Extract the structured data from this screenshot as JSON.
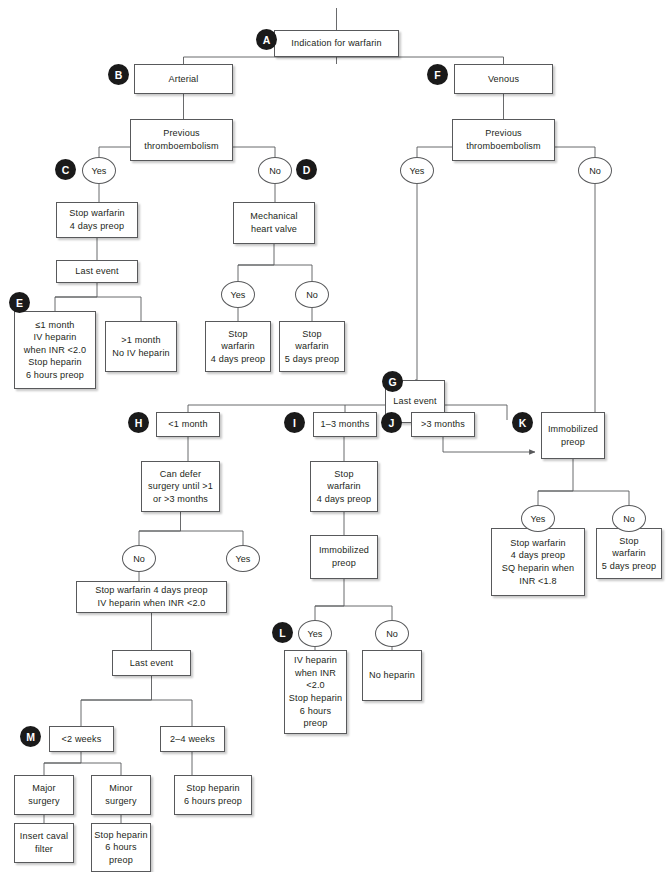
{
  "diagram": {
    "line_color": "#58595b",
    "tag_color": "#1a1a1a",
    "tag_text_color": "#ffffff",
    "box_fill": "#ffffff"
  },
  "tags": [
    {
      "id": "A",
      "label": "A",
      "x": 256,
      "y": 29
    },
    {
      "id": "B",
      "label": "B",
      "x": 108,
      "y": 64
    },
    {
      "id": "C",
      "label": "C",
      "x": 55,
      "y": 159
    },
    {
      "id": "D",
      "label": "D",
      "x": 296,
      "y": 159
    },
    {
      "id": "E",
      "label": "E",
      "x": 9,
      "y": 292
    },
    {
      "id": "F",
      "label": "F",
      "x": 427,
      "y": 64
    },
    {
      "id": "G",
      "label": "G",
      "x": 382,
      "y": 371
    },
    {
      "id": "H",
      "label": "H",
      "x": 128,
      "y": 412
    },
    {
      "id": "I",
      "label": "I",
      "x": 284,
      "y": 412
    },
    {
      "id": "J",
      "label": "J",
      "x": 381,
      "y": 412
    },
    {
      "id": "K",
      "label": "K",
      "x": 512,
      "y": 412
    },
    {
      "id": "L",
      "label": "L",
      "x": 272,
      "y": 622
    },
    {
      "id": "M",
      "label": "M",
      "x": 20,
      "y": 726
    }
  ],
  "nodes": [
    {
      "id": "indication",
      "name": "indication-for-warfarin",
      "text": "Indication for warfarin",
      "x": 274,
      "y": 30,
      "w": 125,
      "h": 27
    },
    {
      "id": "arterial",
      "name": "arterial",
      "text": "Arterial",
      "x": 134,
      "y": 64,
      "w": 99,
      "h": 30
    },
    {
      "id": "venous",
      "name": "venous",
      "text": "Venous",
      "x": 454,
      "y": 64,
      "w": 99,
      "h": 30
    },
    {
      "id": "prev-thromb-left",
      "name": "previous-thromboembolism-arterial",
      "text": "Previous\nthromboembolism",
      "x": 130,
      "y": 119,
      "w": 103,
      "h": 42
    },
    {
      "id": "prev-thromb-right",
      "name": "previous-thromboembolism-venous",
      "text": "Previous\nthromboembolism",
      "x": 452,
      "y": 119,
      "w": 103,
      "h": 42
    },
    {
      "id": "stop-warf-4d-c",
      "name": "stop-warfarin-4-days-preop-c",
      "text": "Stop warfarin\n4 days preop",
      "x": 56,
      "y": 202,
      "w": 82,
      "h": 36
    },
    {
      "id": "last-event-c",
      "name": "last-event-c",
      "text": "Last event",
      "x": 56,
      "y": 260,
      "w": 82,
      "h": 23
    },
    {
      "id": "le1month",
      "name": "less-equal-1-month-iv-heparin",
      "text": "≤1 month\nIV heparin\nwhen INR <2.0\nStop heparin\n6 hours preop",
      "x": 14,
      "y": 311,
      "w": 82,
      "h": 78
    },
    {
      "id": "gt1month",
      "name": "greater-1-month-no-iv-heparin",
      "text": ">1 month\nNo IV heparin",
      "x": 105,
      "y": 321,
      "w": 72,
      "h": 51
    },
    {
      "id": "mech-valve",
      "name": "mechanical-heart-valve",
      "text": "Mechanical\nheart valve",
      "x": 233,
      "y": 202,
      "w": 82,
      "h": 42
    },
    {
      "id": "stop-warf-4d-valve",
      "name": "stop-warfarin-4-days-preop-valve-yes",
      "text": "Stop\nwarfarin\n4 days preop",
      "x": 205,
      "y": 321,
      "w": 66,
      "h": 51
    },
    {
      "id": "stop-warf-5d-valve",
      "name": "stop-warfarin-5-days-preop-valve-no",
      "text": "Stop\nwarfarin\n5 days preop",
      "x": 279,
      "y": 321,
      "w": 66,
      "h": 51
    },
    {
      "id": "last-event-g",
      "name": "last-event-g",
      "text": "Last event",
      "x": 385,
      "y": 380,
      "w": 60,
      "h": 43
    },
    {
      "id": "lt1month",
      "name": "less-1-month",
      "text": "<1 month",
      "x": 156,
      "y": 412,
      "w": 64,
      "h": 25
    },
    {
      "id": "can-defer",
      "name": "can-defer-surgery",
      "text": "Can defer\nsurgery until >1\nor >3 months",
      "x": 141,
      "y": 461,
      "w": 79,
      "h": 51
    },
    {
      "id": "m1to3",
      "name": "one-to-three-months",
      "text": "1–3 months",
      "x": 313,
      "y": 412,
      "w": 64,
      "h": 25
    },
    {
      "id": "stop-warf-4d-i",
      "name": "stop-warfarin-4-days-preop-i",
      "text": "Stop\nwarfarin\n4 days preop",
      "x": 310,
      "y": 461,
      "w": 68,
      "h": 51
    },
    {
      "id": "immob-preop-i",
      "name": "immobilized-preop-i",
      "text": "Immobilized\npreop",
      "x": 310,
      "y": 535,
      "w": 68,
      "h": 44
    },
    {
      "id": "gt3months",
      "name": "greater-3-months",
      "text": ">3 months",
      "x": 411,
      "y": 412,
      "w": 64,
      "h": 25
    },
    {
      "id": "immob-preop-k",
      "name": "immobilized-preop-k",
      "text": "Immobilized\npreop",
      "x": 541,
      "y": 412,
      "w": 64,
      "h": 47
    },
    {
      "id": "stop-warf-sq",
      "name": "stop-warfarin-sq-heparin",
      "text": "Stop warfarin\n4 days preop\nSQ heparin when\nINR <1.8",
      "x": 491,
      "y": 528,
      "w": 94,
      "h": 68
    },
    {
      "id": "stop-warf-5d-k",
      "name": "stop-warfarin-5-days-preop-k",
      "text": "Stop\nwarfarin\n5 days preop",
      "x": 596,
      "y": 528,
      "w": 66,
      "h": 51
    },
    {
      "id": "stop-warf-iv",
      "name": "stop-warfarin-iv-heparin",
      "text": "Stop warfarin 4 days preop\nIV heparin when INR <2.0",
      "x": 76,
      "y": 581,
      "w": 151,
      "h": 32
    },
    {
      "id": "last-event-m",
      "name": "last-event-m",
      "text": "Last event",
      "x": 112,
      "y": 650,
      "w": 79,
      "h": 26
    },
    {
      "id": "lt2weeks",
      "name": "less-2-weeks",
      "text": "<2 weeks",
      "x": 49,
      "y": 726,
      "w": 65,
      "h": 26
    },
    {
      "id": "w2to4",
      "name": "two-to-four-weeks",
      "text": "2–4 weeks",
      "x": 160,
      "y": 726,
      "w": 65,
      "h": 26
    },
    {
      "id": "major-surgery",
      "name": "major-surgery",
      "text": "Major\nsurgery",
      "x": 14,
      "y": 775,
      "w": 60,
      "h": 40
    },
    {
      "id": "minor-surgery",
      "name": "minor-surgery",
      "text": "Minor\nsurgery",
      "x": 91,
      "y": 775,
      "w": 60,
      "h": 40
    },
    {
      "id": "stop-hep-24",
      "name": "stop-heparin-6-hours-preop-2-4-weeks",
      "text": "Stop heparin\n6 hours preop",
      "x": 174,
      "y": 775,
      "w": 78,
      "h": 40
    },
    {
      "id": "insert-caval",
      "name": "insert-caval-filter",
      "text": "Insert caval\nfilter",
      "x": 14,
      "y": 823,
      "w": 60,
      "h": 40
    },
    {
      "id": "stop-hep-minor",
      "name": "stop-heparin-6-hours-preop-minor",
      "text": "Stop heparin\n6 hours\npreop",
      "x": 91,
      "y": 823,
      "w": 60,
      "h": 49
    },
    {
      "id": "iv-heparin-l",
      "name": "iv-heparin-when-inr-l",
      "text": "IV heparin\nwhen INR\n<2.0\nStop heparin\n6 hours\npreop",
      "x": 284,
      "y": 650,
      "w": 63,
      "h": 84
    },
    {
      "id": "no-heparin",
      "name": "no-heparin",
      "text": "No heparin",
      "x": 362,
      "y": 650,
      "w": 60,
      "h": 51
    }
  ],
  "ovals": [
    {
      "id": "yes-c",
      "name": "yes-oval-arterial-thromb",
      "text": "Yes",
      "x": 82,
      "y": 157,
      "w": 34,
      "h": 27
    },
    {
      "id": "no-d",
      "name": "no-oval-arterial-thromb",
      "text": "No",
      "x": 258,
      "y": 157,
      "w": 34,
      "h": 27
    },
    {
      "id": "yes-f",
      "name": "yes-oval-venous-thromb",
      "text": "Yes",
      "x": 400,
      "y": 157,
      "w": 34,
      "h": 27
    },
    {
      "id": "no-f",
      "name": "no-oval-venous-thromb",
      "text": "No",
      "x": 578,
      "y": 157,
      "w": 34,
      "h": 27
    },
    {
      "id": "yes-valve",
      "name": "yes-oval-mechanical-valve",
      "text": "Yes",
      "x": 221,
      "y": 281,
      "w": 34,
      "h": 27
    },
    {
      "id": "no-valve",
      "name": "no-oval-mechanical-valve",
      "text": "No",
      "x": 295,
      "y": 281,
      "w": 34,
      "h": 27
    },
    {
      "id": "no-defer",
      "name": "no-oval-can-defer",
      "text": "No",
      "x": 122,
      "y": 545,
      "w": 34,
      "h": 27
    },
    {
      "id": "yes-defer",
      "name": "yes-oval-can-defer",
      "text": "Yes",
      "x": 226,
      "y": 545,
      "w": 34,
      "h": 27
    },
    {
      "id": "yes-immob-i",
      "name": "yes-oval-immobilized-i",
      "text": "Yes",
      "x": 298,
      "y": 620,
      "w": 34,
      "h": 27
    },
    {
      "id": "no-immob-i",
      "name": "no-oval-immobilized-i",
      "text": "No",
      "x": 375,
      "y": 620,
      "w": 34,
      "h": 27
    },
    {
      "id": "yes-immob-k",
      "name": "yes-oval-immobilized-k",
      "text": "Yes",
      "x": 521,
      "y": 505,
      "w": 34,
      "h": 27
    },
    {
      "id": "no-immob-k",
      "name": "no-oval-immobilized-k",
      "text": "No",
      "x": 612,
      "y": 505,
      "w": 34,
      "h": 27
    }
  ],
  "connectors": {
    "description": "Orthogonal connector polylines joining the decision nodes",
    "paths": [
      "M336.5 8 L336.5 30",
      "M336.5 57 L336.5 64 M183.5 64 L183.5 57 L503.5 57 L503.5 64",
      "M183.5 94 L183.5 119",
      "M503.5 94 L503.5 119",
      "M99 157 L99 147 L181.5 147 M181.5 161 L181.5 147 L275 147 L275 157",
      "M417 157 L417 147 L503.5 147 M503.5 161 L503.5 147 L595 147 L595 157",
      "M99 184 L99 202",
      "M275 184 L275 202",
      "M97 238 L97 260",
      "M97 283 L97 297 L55 297 L55 311 M141 297 L141 321 M55 297 L141 297",
      "M274 244 L274 265 L238 265 L238 281 M312 265 L312 281 M238 265 L312 265",
      "M238 308 L238 321",
      "M312 308 L312 321",
      "M417 184 L417 380 L415 380",
      "M595 184 L595 412",
      "M415 423 L415 437",
      "M188 437 L188 405 L415 405 M345 437 L345 405 M443 437 L443 405 L507 405 L507 420",
      "M188 437 L188 461",
      "M180.5 512 L180.5 531 L139 531 L139 545 M243 531 L243 545 M139 531 L243 531",
      "M139 572 L139 581",
      "M443 437 L443 452 L535 452",
      "M344 437 L344 461",
      "M344 512 L344 535",
      "M344 579 L344 606 L315 606 L315 620 M392 606 L392 620 M315 606 L392 606",
      "M315 647 L315 650",
      "M392 647 L392 650",
      "M573 459 L573 491 L538 491 L538 505 M629 491 L629 505 M538 491 L629 491",
      "M538 532 L538 528",
      "M629 532 L629 528",
      "M151.5 613 L151.5 650",
      "M151.5 676 L151.5 700 L81 700 L81 726 M192 700 L192 726 M81 700 L192 700",
      "M81 752 L81 763 L44 763 L44 775 M121 763 L121 775 M44 763 L121 763",
      "M192 752 L192 775",
      "M44 815 L44 823",
      "M121 815 L121 823"
    ]
  }
}
